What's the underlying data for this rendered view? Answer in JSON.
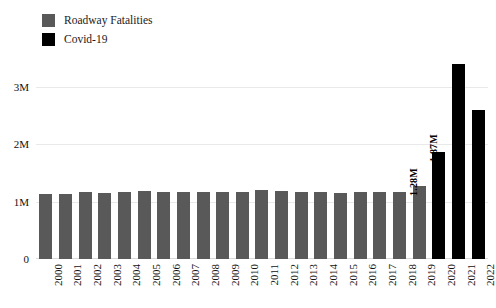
{
  "legend": {
    "position": "top-left",
    "items": [
      {
        "label": "Roadway Fatalities",
        "color": "#595959",
        "swatch_name": "legend-swatch-roadway"
      },
      {
        "label": "Covid-19",
        "color": "#000000",
        "swatch_name": "legend-swatch-covid"
      }
    ]
  },
  "axes": {
    "y_ticks": [
      "0",
      "1M",
      "2M",
      "3M"
    ],
    "y_tick_values": [
      0,
      1000000,
      2000000,
      3000000
    ],
    "ylim": [
      0,
      3500000
    ],
    "gridlines": true
  },
  "chart_data": {
    "type": "bar",
    "title": "",
    "subtitle": "",
    "xlabel": "",
    "ylabel": "",
    "ylim": [
      0,
      3500000
    ],
    "grid": true,
    "legend_position": "top-left",
    "categories": [
      "2000",
      "2001",
      "2002",
      "2003",
      "2004",
      "2005",
      "2006",
      "2007",
      "2008",
      "2009",
      "2010",
      "2011",
      "2012",
      "2013",
      "2014",
      "2015",
      "2016",
      "2017",
      "2018",
      "2019",
      "2020",
      "2021",
      "2022"
    ],
    "series": [
      {
        "name": "Roadway Fatalities",
        "color": "#595959",
        "values": [
          1130000,
          1125000,
          1160000,
          1155000,
          1160000,
          1180000,
          1175000,
          1170000,
          1165000,
          1165000,
          1170000,
          1195000,
          1185000,
          1165000,
          1160000,
          1155000,
          1165000,
          1160000,
          1170000,
          1280000,
          null,
          null,
          null
        ],
        "labels": [
          "",
          "",
          "",
          "",
          "",
          "",
          "",
          "",
          "",
          "",
          "",
          "",
          "",
          "",
          "",
          "",
          "",
          "",
          "",
          "1.28M",
          "",
          "",
          ""
        ]
      },
      {
        "name": "Covid-19",
        "color": "#000000",
        "values": [
          null,
          null,
          null,
          null,
          null,
          null,
          null,
          null,
          null,
          null,
          null,
          null,
          null,
          null,
          null,
          null,
          null,
          null,
          null,
          null,
          1870000,
          3400000,
          2600000
        ],
        "labels": [
          "",
          "",
          "",
          "",
          "",
          "",
          "",
          "",
          "",
          "",
          "",
          "",
          "",
          "",
          "",
          "",
          "",
          "",
          "",
          "",
          "1.87M",
          "",
          ""
        ]
      }
    ]
  }
}
